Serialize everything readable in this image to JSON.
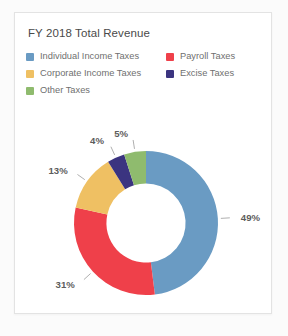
{
  "card": {
    "title": "FY 2018 Total Revenue",
    "background": "#ffffff",
    "border_color": "#e3e3e3"
  },
  "legend": {
    "position": "top",
    "columns": [
      {
        "items": [
          {
            "label": "Individual Income Taxes",
            "color": "#6a9bc3"
          },
          {
            "label": "Corporate Income Taxes",
            "color": "#efc063"
          },
          {
            "label": "Other Taxes",
            "color": "#8fbb6e"
          }
        ]
      },
      {
        "items": [
          {
            "label": "Payroll Taxes",
            "color": "#ef404a"
          },
          {
            "label": "Excise Taxes",
            "color": "#3b3480"
          }
        ]
      }
    ]
  },
  "chart_data": {
    "type": "pie",
    "variant": "donut",
    "title": "FY 2018 Total Revenue",
    "xlabel": "",
    "ylabel": "",
    "legend_position": "top",
    "grid": false,
    "units": "percent",
    "inner_radius_ratio": 0.55,
    "start_angle_deg": 0,
    "direction": "clockwise",
    "categories": [
      "Individual Income Taxes",
      "Payroll Taxes",
      "Corporate Income Taxes",
      "Excise Taxes",
      "Other Taxes"
    ],
    "values": [
      49,
      31,
      13,
      4,
      5
    ],
    "labels": [
      "49%",
      "31%",
      "13%",
      "4%",
      "5%"
    ],
    "colors": [
      "#6a9bc3",
      "#ef404a",
      "#efc063",
      "#3b3480",
      "#8fbb6e"
    ],
    "slices": [
      {
        "name": "Individual Income Taxes",
        "value": 49,
        "label": "49%",
        "color": "#6a9bc3"
      },
      {
        "name": "Payroll Taxes",
        "value": 31,
        "label": "31%",
        "color": "#ef404a"
      },
      {
        "name": "Corporate Income Taxes",
        "value": 13,
        "label": "13%",
        "color": "#efc063"
      },
      {
        "name": "Excise Taxes",
        "value": 4,
        "label": "4%",
        "color": "#3b3480"
      },
      {
        "name": "Other Taxes",
        "value": 5,
        "label": "5%",
        "color": "#8fbb6e"
      }
    ]
  }
}
